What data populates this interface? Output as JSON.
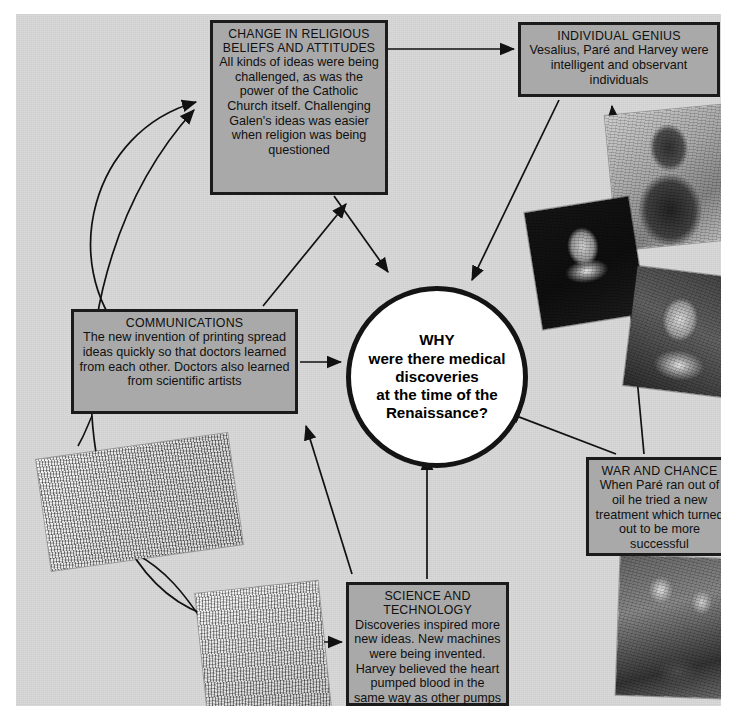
{
  "centre": {
    "name": "central-question",
    "text": "WHY\nwere there medical\ndiscoveries\nat the time of the\nRenaissance?",
    "lines": [
      "WHY",
      "were there medical",
      "discoveries",
      "at the time of the",
      "Renaissance?"
    ]
  },
  "nodes": [
    {
      "id": "religion",
      "title": "CHANGE IN RELIGIOUS BELIEFS AND ATTITUDES",
      "body": "All kinds of ideas were being challenged, as was the power of the Catholic Church itself. Challenging Galen's ideas was easier when religion was being questioned"
    },
    {
      "id": "genius",
      "title": "INDIVIDUAL GENIUS",
      "body": "Vesalius, Paré and Harvey were intelligent and observant individuals"
    },
    {
      "id": "communications",
      "title": "COMMUNICATIONS",
      "body": "The new invention of printing spread ideas quickly so that doctors learned from each other. Doctors also learned from scientific artists"
    },
    {
      "id": "war",
      "title": "WAR AND CHANCE",
      "body": "When Paré ran out of oil he tried a new treatment which turned out to be more successful"
    },
    {
      "id": "science",
      "title": "SCIENCE AND TECHNOLOGY",
      "body": "Discoveries inspired more new ideas. New machines were being invented. Harvey believed the heart pumped blood in the same way as other pumps pumped water"
    }
  ],
  "images": [
    {
      "id": "vesalius",
      "caption": "portrait-engraving-of-vesalius"
    },
    {
      "id": "pare",
      "caption": "portrait-of-ambroise-pare"
    },
    {
      "id": "harvey",
      "caption": "portrait-of-william-harvey"
    },
    {
      "id": "printing",
      "caption": "engraving-of-printing-workshop"
    },
    {
      "id": "machine",
      "caption": "engraving-of-water-powered-machine"
    },
    {
      "id": "surgery",
      "caption": "engraving-of-battlefield-surgery"
    }
  ],
  "colors": {
    "background": "#d6d6d6",
    "page": "#ffffff",
    "box_fill": "#a9a9a9",
    "box_border": "#1b1b1b",
    "circle_fill": "#ffffff",
    "circle_border": "#141414",
    "arrow": "#111111"
  },
  "connections": [
    {
      "from": "religion",
      "to": "genius",
      "style": "straight"
    },
    {
      "from": "religion",
      "to": "centre",
      "style": "straight"
    },
    {
      "from": "genius",
      "to": "centre",
      "style": "straight"
    },
    {
      "from": "communications",
      "to": "centre",
      "style": "straight"
    },
    {
      "from": "communications",
      "to": "religion",
      "style": "straight"
    },
    {
      "from": "science",
      "to": "centre",
      "style": "straight"
    },
    {
      "from": "science",
      "to": "communications",
      "style": "straight"
    },
    {
      "from": "war",
      "to": "centre",
      "style": "straight"
    },
    {
      "from": "war",
      "to": "genius",
      "style": "straight"
    },
    {
      "from": "science",
      "to": "religion",
      "style": "curved"
    },
    {
      "from": "communications",
      "to": "religion",
      "style": "curved"
    }
  ]
}
